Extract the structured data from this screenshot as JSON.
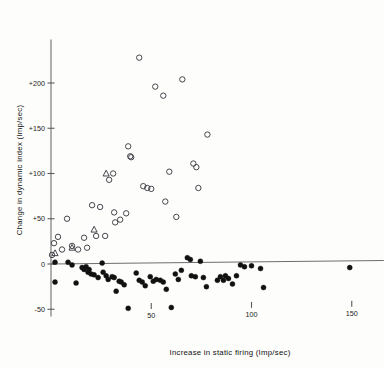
{
  "chart_data": {
    "type": "scatter",
    "title": "",
    "xlabel": "Increase in static firing (Imp/sec)",
    "ylabel": "Change in dynamic index (Imp/sec)",
    "xlim": [
      -6,
      166
    ],
    "ylim": [
      -58,
      248
    ],
    "xticks": [
      50,
      100,
      150
    ],
    "xticklabels": [
      "50",
      "100",
      "150"
    ],
    "yticks": [
      -50,
      0,
      50,
      100,
      150,
      200
    ],
    "yticklabels": [
      "-50",
      "0",
      "+50",
      "+100",
      "+150",
      "+200"
    ],
    "grid": false,
    "legend": false,
    "series": [
      {
        "name": "open-circles",
        "marker": "open-circle",
        "color": "#3c3c44",
        "points": [
          [
            0.5,
            10
          ],
          [
            1.5,
            23
          ],
          [
            3.5,
            30
          ],
          [
            5.5,
            16
          ],
          [
            8.0,
            50
          ],
          [
            10.5,
            20
          ],
          [
            13.5,
            16
          ],
          [
            16.5,
            29
          ],
          [
            18.0,
            18
          ],
          [
            20.5,
            65
          ],
          [
            22.5,
            31
          ],
          [
            24.5,
            63
          ],
          [
            27.0,
            31
          ],
          [
            29.0,
            93
          ],
          [
            31.0,
            100
          ],
          [
            31.5,
            57
          ],
          [
            32.0,
            46
          ],
          [
            34.5,
            49
          ],
          [
            37.5,
            56
          ],
          [
            38.5,
            130
          ],
          [
            39.5,
            119
          ],
          [
            40.0,
            118
          ],
          [
            44.0,
            228
          ],
          [
            46.0,
            86
          ],
          [
            48.0,
            84
          ],
          [
            50.0,
            83
          ],
          [
            52.0,
            196
          ],
          [
            56.0,
            186
          ],
          [
            57.0,
            69
          ],
          [
            59.0,
            102
          ],
          [
            62.5,
            52
          ],
          [
            65.5,
            204
          ],
          [
            71.0,
            111
          ],
          [
            72.5,
            107
          ],
          [
            73.5,
            84
          ],
          [
            78.0,
            143
          ]
        ]
      },
      {
        "name": "open-triangles",
        "marker": "open-triangle",
        "color": "#3c3c44",
        "points": [
          [
            2.0,
            12
          ],
          [
            10.5,
            18
          ],
          [
            21.5,
            38
          ],
          [
            27.5,
            100
          ]
        ]
      },
      {
        "name": "filled-circles",
        "marker": "filled-circle",
        "color": "#111111",
        "points": [
          [
            2.0,
            2
          ],
          [
            2.0,
            -20
          ],
          [
            8.5,
            2
          ],
          [
            10.5,
            -1
          ],
          [
            12.5,
            -21
          ],
          [
            15.5,
            -4
          ],
          [
            16.5,
            -6
          ],
          [
            17.5,
            -3
          ],
          [
            18.5,
            -9
          ],
          [
            19.0,
            -6
          ],
          [
            20.0,
            -11
          ],
          [
            21.5,
            -12
          ],
          [
            23.5,
            -15
          ],
          [
            25.5,
            1
          ],
          [
            26.0,
            -9
          ],
          [
            27.5,
            -13
          ],
          [
            28.5,
            -17
          ],
          [
            30.5,
            -14
          ],
          [
            31.5,
            -15
          ],
          [
            32.5,
            -30
          ],
          [
            34.0,
            -19
          ],
          [
            35.0,
            -20
          ],
          [
            36.5,
            -23
          ],
          [
            38.5,
            -49
          ],
          [
            42.5,
            -10
          ],
          [
            44.0,
            -18
          ],
          [
            45.5,
            -20
          ],
          [
            47.0,
            -24
          ],
          [
            49.5,
            -14
          ],
          [
            51.0,
            -19
          ],
          [
            52.5,
            -17
          ],
          [
            54.5,
            -18
          ],
          [
            56.0,
            -20
          ],
          [
            57.5,
            -28
          ],
          [
            60.0,
            -48
          ],
          [
            62.0,
            -11
          ],
          [
            63.5,
            -17
          ],
          [
            65.0,
            -7
          ],
          [
            68.0,
            7
          ],
          [
            69.5,
            5
          ],
          [
            70.0,
            -13
          ],
          [
            72.0,
            -14
          ],
          [
            74.5,
            3
          ],
          [
            76.0,
            -15
          ],
          [
            77.5,
            -25
          ],
          [
            83.0,
            -18
          ],
          [
            84.5,
            -14
          ],
          [
            86.0,
            -18
          ],
          [
            87.0,
            -13
          ],
          [
            88.5,
            -16
          ],
          [
            90.5,
            -22
          ],
          [
            92.5,
            -13
          ],
          [
            94.5,
            -1
          ],
          [
            96.5,
            -3
          ],
          [
            100.0,
            -2
          ],
          [
            104.5,
            -5
          ],
          [
            106.0,
            -26
          ],
          [
            149.0,
            -4
          ]
        ]
      }
    ]
  }
}
